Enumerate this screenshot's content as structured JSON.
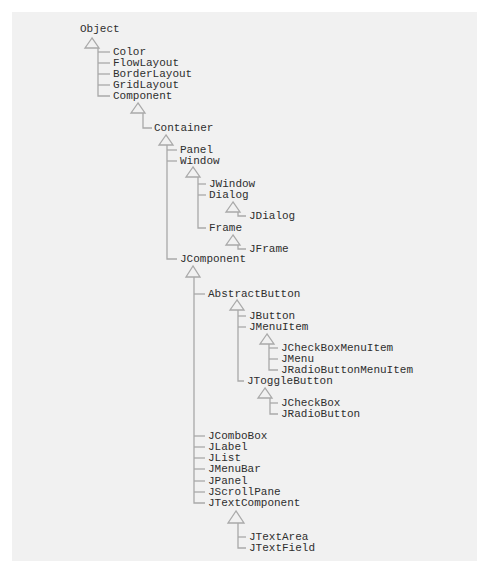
{
  "diagram": {
    "colors": {
      "background": "#f1f1f1",
      "text": "#2e2e2e",
      "lines": "#a9a9a9"
    },
    "nodes": {
      "object": "Object",
      "color": "Color",
      "flowlayout": "FlowLayout",
      "borderlayout": "BorderLayout",
      "gridlayout": "GridLayout",
      "component": "Component",
      "container": "Container",
      "panel": "Panel",
      "window": "Window",
      "jwindow": "JWindow",
      "dialog": "Dialog",
      "jdialog": "JDialog",
      "frame": "Frame",
      "jframe": "JFrame",
      "jcomponent": "JComponent",
      "abstractbutton": "AbstractButton",
      "jbutton": "JButton",
      "jmenuitem": "JMenuItem",
      "jcheckboxmenuitem": "JCheckBoxMenuItem",
      "jmenu": "JMenu",
      "jradiobuttonmenuitem": "JRadioButtonMenuItem",
      "jtogglebutton": "JToggleButton",
      "jcheckbox": "JCheckBox",
      "jradiobutton": "JRadioButton",
      "jcombobox": "JComboBox",
      "jlabel": "JLabel",
      "jlist": "JList",
      "jmenubar": "JMenuBar",
      "jpanel": "JPanel",
      "jscrollpane": "JScrollPane",
      "jtextcomponent": "JTextComponent",
      "jtextarea": "JTextArea",
      "jtextfield": "JTextField"
    },
    "hierarchy": {
      "Object": [
        "Color",
        "FlowLayout",
        "BorderLayout",
        "GridLayout",
        "Component"
      ],
      "Component": [
        "Container"
      ],
      "Container": [
        "Panel",
        "Window",
        "JComponent"
      ],
      "Window": [
        "JWindow",
        "Dialog",
        "Frame"
      ],
      "Dialog": [
        "JDialog"
      ],
      "Frame": [
        "JFrame"
      ],
      "JComponent": [
        "AbstractButton",
        "JComboBox",
        "JLabel",
        "JList",
        "JMenuBar",
        "JPanel",
        "JScrollPane",
        "JTextComponent"
      ],
      "AbstractButton": [
        "JButton",
        "JMenuItem",
        "JToggleButton"
      ],
      "JMenuItem": [
        "JCheckBoxMenuItem",
        "JMenu",
        "JRadioButtonMenuItem"
      ],
      "JToggleButton": [
        "JCheckBox",
        "JRadioButton"
      ],
      "JTextComponent": [
        "JTextArea",
        "JTextField"
      ]
    }
  }
}
